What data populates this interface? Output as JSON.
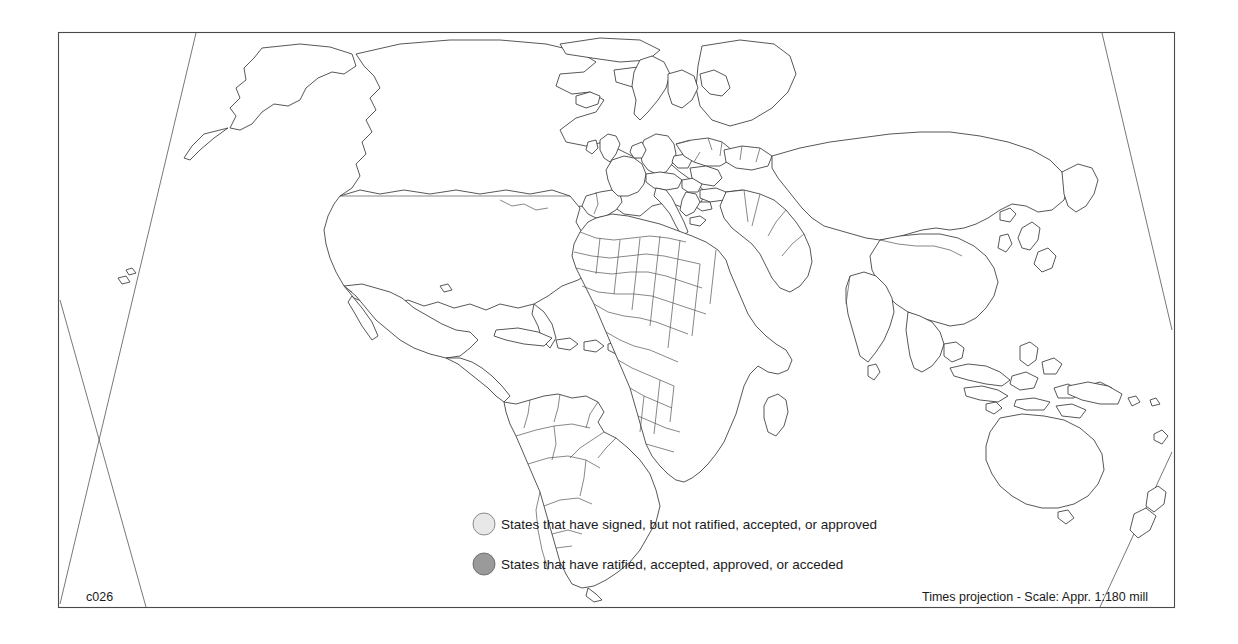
{
  "map": {
    "title": "World map of treaty signature and ratification status",
    "projection_note": "Times projection - Scale: Appr. 1:180 mill",
    "sheet_code": "c026",
    "frame": {
      "x": 58,
      "y": 32,
      "width": 1117,
      "height": 576
    },
    "colors": {
      "background": "#ffffff",
      "land_fill": "#ffffff",
      "coast_stroke": "#3a3a3a",
      "border_stroke": "#555555",
      "frame_stroke": "#4a4a4a",
      "signed_fill": "#e4e4e4",
      "ratified_fill": "#a8a8a8",
      "legend_signed_circle": "#e8e8e8",
      "legend_ratified_circle": "#9a9a9a",
      "text": "#1a1a1a"
    }
  },
  "legend": {
    "items": [
      {
        "marker": "signed-circle",
        "fill": "#e8e8e8",
        "label": "States that have signed, but not ratified, accepted, or approved"
      },
      {
        "marker": "ratified-circle",
        "fill": "#9a9a9a",
        "label": "States that have ratified, accepted, approved, or acceded"
      }
    ],
    "position": {
      "x": 476,
      "y": 524
    }
  },
  "footer": {
    "left_label": "c026",
    "right_label": "Times projection - Scale: Appr. 1:180 mill"
  },
  "shaded_regions": {
    "signed": [
      "France",
      "Italy",
      "Switzerland",
      "Austria",
      "Netherlands",
      "Belgium",
      "Luxembourg",
      "Slovenia",
      "Croatia"
    ],
    "ratified": [
      "Germany",
      "Czech Republic",
      "Bulgaria",
      "North Macedonia"
    ]
  }
}
